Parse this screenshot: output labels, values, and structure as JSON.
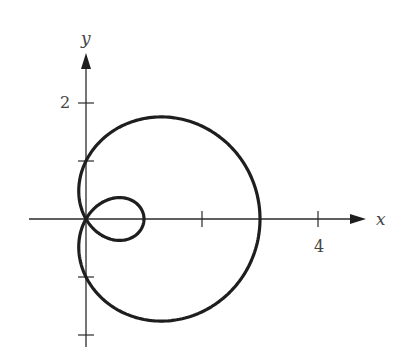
{
  "chart_data": {
    "type": "line",
    "title": "",
    "subtitle": "",
    "equation": "r = 1 + 2cos(θ)",
    "polar": {
      "a": 1,
      "b": 2,
      "theta_start": 0,
      "theta_end": 6.2832,
      "samples": 360
    },
    "xlabel": "x",
    "ylabel": "y",
    "xlim": [
      -1,
      5
    ],
    "ylim": [
      -2.2,
      3
    ],
    "grid": false,
    "legend": null,
    "x_ticks": [
      {
        "value": 2,
        "label": ""
      },
      {
        "value": 4,
        "label": "4"
      }
    ],
    "y_ticks": [
      {
        "value": 2,
        "label": "2"
      },
      {
        "value": 1,
        "label": ""
      },
      {
        "value": -1,
        "label": ""
      },
      {
        "value": -2,
        "label": ""
      }
    ],
    "key_points": [
      {
        "x": 3,
        "y": 0,
        "note": "outer loop x-intercept"
      },
      {
        "x": 1,
        "y": 0,
        "note": "inner loop x-intercept"
      },
      {
        "x": 0,
        "y": 1,
        "note": "y-intercept"
      },
      {
        "x": 0,
        "y": -1,
        "note": "y-intercept"
      },
      {
        "x": 0,
        "y": 0,
        "note": "pole / self-intersection"
      }
    ]
  },
  "labels": {
    "x_axis": "x",
    "y_axis": "y",
    "x_tick_4": "4",
    "y_tick_2": "2"
  },
  "layout": {
    "origin_px": [
      86,
      219
    ],
    "unit_px": 58,
    "x_axis_start_px": 29,
    "x_axis_end_px": 366,
    "y_axis_top_px": 53,
    "y_axis_bottom_px": 347
  }
}
